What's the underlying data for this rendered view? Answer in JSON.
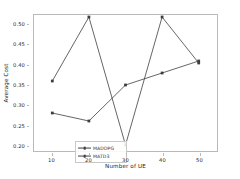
{
  "chart_data": {
    "type": "line",
    "title": "",
    "subtitle": "",
    "xlabel": "Number of UE",
    "ylabel": "Average Cost",
    "x": [
      10,
      20,
      30,
      40,
      50
    ],
    "xticks": [
      "10",
      "20",
      "30",
      "40",
      "50"
    ],
    "yticks": [
      "0.20",
      "0.25",
      "0.30",
      "0.35",
      "0.40",
      "0.45",
      "0.50"
    ],
    "xlim": [
      5,
      55
    ],
    "ylim": [
      0.185,
      0.525
    ],
    "grid": false,
    "legend_position": "lower left",
    "marker": "square",
    "series": [
      {
        "name": "MADDPG",
        "color": "#3d3d3d",
        "values": [
          0.36,
          0.52,
          0.2,
          0.52,
          0.405
        ]
      },
      {
        "name": "MATD3",
        "color": "#3d3d3d",
        "values": [
          0.28,
          0.26,
          0.35,
          0.38,
          0.41
        ]
      }
    ]
  },
  "legend": {
    "items": [
      {
        "label": "MADDPG"
      },
      {
        "label": "MATD3"
      }
    ]
  },
  "colors": {
    "line": "#3d3d3d",
    "spine": "#b9b9b9",
    "background": "#ffffff",
    "text": "#262626"
  }
}
